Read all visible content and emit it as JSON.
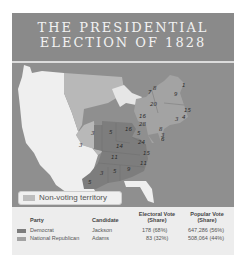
{
  "title": {
    "line1": "THE PRESIDENTIAL",
    "line2": "ELECTION OF 1828"
  },
  "map": {
    "legend": {
      "label": "Non-voting territory",
      "color": "#bdbdbd"
    },
    "colors": {
      "ocean": "#8f8f8f",
      "west": "#efefef",
      "territory": "#b8b8b8",
      "democrat": "#7d7d7d",
      "national_republican": "#a3a3a3"
    },
    "state_votes": [
      {
        "value": "8",
        "x": 141,
        "y": 27
      },
      {
        "value": "7",
        "x": 136,
        "y": 31
      },
      {
        "value": "9",
        "x": 162,
        "y": 33
      },
      {
        "value": "1",
        "x": 170,
        "y": 24
      },
      {
        "value": "20",
        "x": 138,
        "y": 43
      },
      {
        "value": "16",
        "x": 127,
        "y": 55
      },
      {
        "value": "15",
        "x": 172,
        "y": 49
      },
      {
        "value": "4",
        "x": 170,
        "y": 56
      },
      {
        "value": "3",
        "x": 163,
        "y": 58
      },
      {
        "value": "28",
        "x": 127,
        "y": 63
      },
      {
        "value": "8",
        "x": 147,
        "y": 68
      },
      {
        "value": "3",
        "x": 149,
        "y": 74
      },
      {
        "value": "6",
        "x": 149,
        "y": 78
      },
      {
        "value": "5",
        "x": 125,
        "y": 72
      },
      {
        "value": "3",
        "x": 79,
        "y": 72
      },
      {
        "value": "5",
        "x": 97,
        "y": 71
      },
      {
        "value": "16",
        "x": 113,
        "y": 68
      },
      {
        "value": "24",
        "x": 126,
        "y": 81
      },
      {
        "value": "3",
        "x": 67,
        "y": 84
      },
      {
        "value": "14",
        "x": 104,
        "y": 85
      },
      {
        "value": "15",
        "x": 131,
        "y": 92
      },
      {
        "value": "11",
        "x": 99,
        "y": 96
      },
      {
        "value": "11",
        "x": 128,
        "y": 102
      },
      {
        "value": "3",
        "x": 88,
        "y": 112
      },
      {
        "value": "5",
        "x": 101,
        "y": 110
      },
      {
        "value": "9",
        "x": 115,
        "y": 108
      },
      {
        "value": "5",
        "x": 76,
        "y": 121
      }
    ]
  },
  "table": {
    "headers": {
      "party": "Party",
      "candidate": "Candidate",
      "electoral_vote": "Electoral Vote",
      "electoral_share": "(Share)",
      "popular_vote": "Popular Vote",
      "popular_share": "(Share)"
    },
    "rows": [
      {
        "party": "Democrat",
        "candidate": "Jackson",
        "electoral": "178 (68%)",
        "popular": "647,286 (56%)",
        "color": "#7d7d7d"
      },
      {
        "party": "National Republican",
        "candidate": "Adams",
        "electoral": "83 (32%)",
        "popular": "508,064 (44%)",
        "color": "#a3a3a3"
      }
    ]
  }
}
